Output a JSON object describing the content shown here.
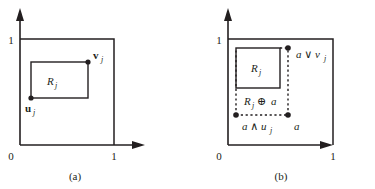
{
  "figure": {
    "background_color": "#ffffff",
    "ink_color": "#231f20",
    "width": 375,
    "height": 189
  },
  "panels": [
    {
      "id": "a",
      "caption": "(a)",
      "axes": {
        "origin_label": "0",
        "y_top_tick_label": "1",
        "x_right_tick_label": "1"
      },
      "labels": {
        "region": "R",
        "region_sub": "j",
        "lower_vertex": "u",
        "lower_vertex_sub": "j",
        "upper_vertex": "v",
        "upper_vertex_sub": "j"
      }
    },
    {
      "id": "b",
      "caption": "(b)",
      "axes": {
        "origin_label": "0",
        "y_top_tick_label": "1",
        "x_right_tick_label": "1"
      },
      "labels": {
        "region": "R",
        "region_sub": "j",
        "minkowski": "R",
        "minkowski_sub": "j",
        "minkowski_op": "⊕",
        "minkowski_operand": "a",
        "join_label": "a ∨ v",
        "join_sub": "j",
        "meet_label": "a ∧ u",
        "meet_sub": "j",
        "point_label": "a"
      }
    }
  ]
}
